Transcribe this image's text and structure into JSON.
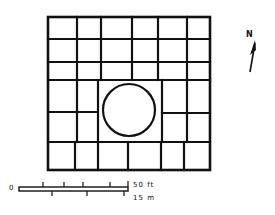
{
  "diagram": {
    "type": "site-plan",
    "stroke_color": "#111111",
    "background": "#ffffff",
    "grid": {
      "outer": {
        "x": 48,
        "y": 17,
        "w": 162,
        "h": 153
      },
      "horizontal_lines": [
        {
          "x1": 48,
          "x2": 210,
          "y": 39
        },
        {
          "x1": 48,
          "x2": 210,
          "y": 62
        },
        {
          "x1": 48,
          "x2": 210,
          "y": 80
        },
        {
          "x1": 48,
          "x2": 98,
          "y": 112
        },
        {
          "x1": 162,
          "x2": 210,
          "y": 113
        },
        {
          "x1": 48,
          "x2": 210,
          "y": 142
        }
      ],
      "vertical_lines": [
        {
          "x": 77,
          "y1": 17,
          "y2": 80
        },
        {
          "x": 101,
          "y1": 17,
          "y2": 80
        },
        {
          "x": 132,
          "y1": 17,
          "y2": 80
        },
        {
          "x": 158,
          "y1": 17,
          "y2": 80
        },
        {
          "x": 187,
          "y1": 17,
          "y2": 80
        },
        {
          "x": 77,
          "y1": 80,
          "y2": 142
        },
        {
          "x": 98,
          "y1": 80,
          "y2": 142
        },
        {
          "x": 162,
          "y1": 80,
          "y2": 142
        },
        {
          "x": 187,
          "y1": 80,
          "y2": 142
        },
        {
          "x": 75,
          "y1": 142,
          "y2": 170
        },
        {
          "x": 98,
          "y1": 142,
          "y2": 170
        },
        {
          "x": 128,
          "y1": 142,
          "y2": 170
        },
        {
          "x": 161,
          "y1": 142,
          "y2": 170
        },
        {
          "x": 184,
          "y1": 142,
          "y2": 170
        }
      ],
      "circle": {
        "cx": 129,
        "cy": 110,
        "r": 26
      }
    },
    "north_arrow": {
      "label": "N"
    },
    "scale_bar": {
      "zero_label": "0",
      "imperial_label": "50 ft",
      "metric_label": "15 m"
    }
  }
}
